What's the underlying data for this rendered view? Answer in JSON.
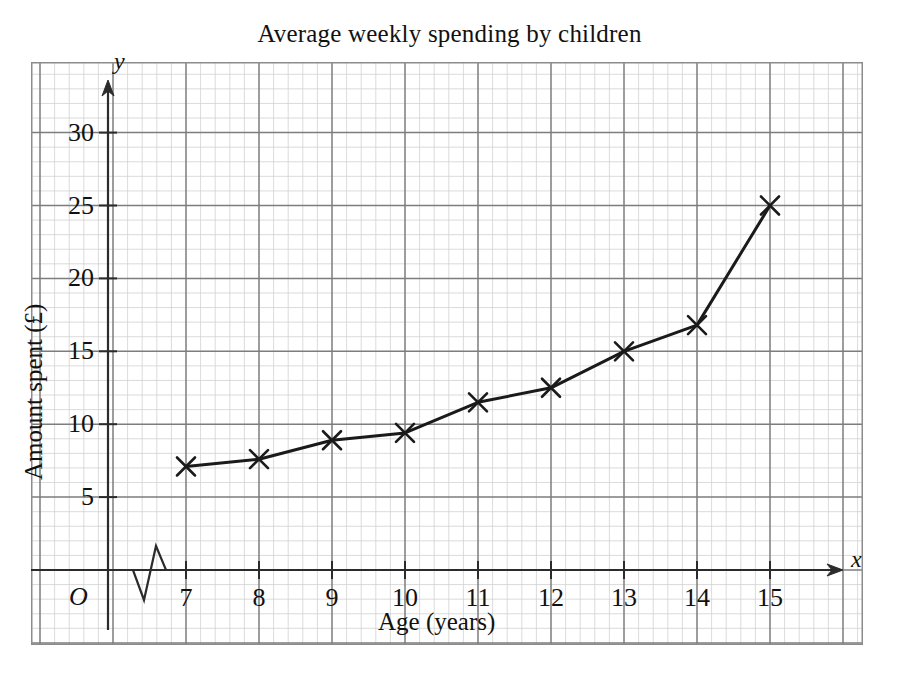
{
  "chart_data": {
    "type": "line",
    "title": "Average weekly spending by children",
    "xlabel": "Age (years)",
    "ylabel": "Amount spent (£)",
    "x_axis_variable": "x",
    "y_axis_variable": "y",
    "origin_label": "O",
    "x": [
      7,
      8,
      9,
      10,
      11,
      12,
      13,
      14,
      15
    ],
    "values": [
      7.1,
      7.6,
      8.9,
      9.4,
      11.5,
      12.5,
      15.0,
      16.8,
      25.0
    ],
    "categories": [
      "7",
      "8",
      "9",
      "10",
      "11",
      "12",
      "13",
      "14",
      "15"
    ],
    "xlim": [
      6.6,
      15.6
    ],
    "ylim": [
      0,
      32
    ],
    "x_ticks": [
      7,
      8,
      9,
      10,
      11,
      12,
      13,
      14,
      15
    ],
    "x_tick_labels": [
      "7",
      "8",
      "9",
      "10",
      "11",
      "12",
      "13",
      "14",
      "15"
    ],
    "y_ticks": [
      5,
      10,
      15,
      20,
      25,
      30
    ],
    "y_tick_labels": [
      "5",
      "10",
      "15",
      "20",
      "25",
      "30"
    ],
    "grid": true,
    "grid_major_color": "#7a7a7a",
    "grid_minor_color": "#cfcfcf",
    "axis_color": "#333333",
    "series_color": "#1a1a1a",
    "marker": "cross",
    "legend": "none",
    "x_axis_break": true
  },
  "axis_labels": {
    "x_title": "Age (years)",
    "y_title": "Amount spent (£)",
    "x_variable": "x",
    "y_variable": "y",
    "origin": "O"
  }
}
